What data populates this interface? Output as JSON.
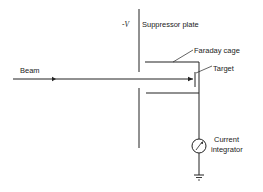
{
  "diagram": {
    "labels": {
      "voltage": "-V",
      "suppressor_plate": "Suppressor plate",
      "faraday_cage": "Faraday cage",
      "target": "Target",
      "beam": "Beam",
      "current_integrator_line1": "Current",
      "current_integrator_line2": "integrator"
    },
    "colors": {
      "line": "#222222",
      "background": "#ffffff"
    }
  }
}
